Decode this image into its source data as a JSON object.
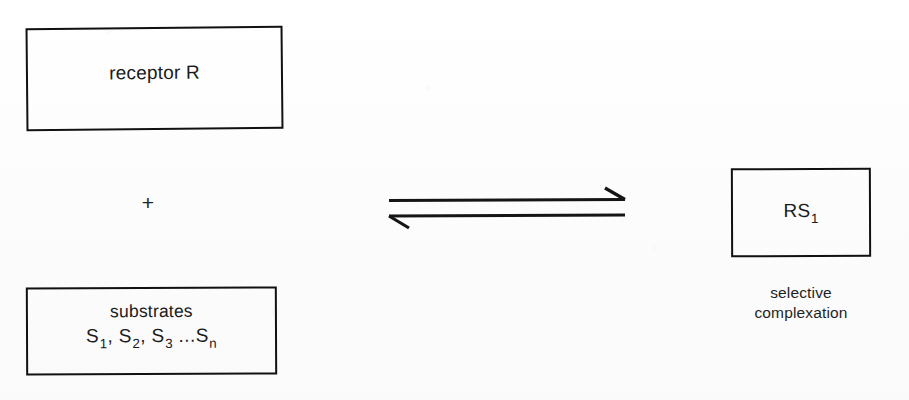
{
  "diagram": {
    "ink_color": "#111111",
    "paper_color": "#fdfdfd",
    "reactants": {
      "receptor_box": {
        "label": "receptor R"
      },
      "operator": "+",
      "substrates_box": {
        "line1": "substrates",
        "formula_prefix": "S",
        "formula_items": [
          "S",
          "S",
          "S"
        ],
        "subscripts": [
          "1",
          "2",
          "3"
        ],
        "separator": ",",
        "ellipsis": "...",
        "last_symbol": "S",
        "last_subscript": "n",
        "formula_plain": "S1 , S2 , S3 ...Sn"
      }
    },
    "arrow": {
      "kind": "equilibrium-double-arrow",
      "forward_direction": "right",
      "reverse_direction": "left"
    },
    "product": {
      "product_box": {
        "symbol": "RS",
        "subscript": "1",
        "label_plain": "RS1"
      },
      "caption_line1": "selective",
      "caption_line2": "complexation"
    }
  }
}
